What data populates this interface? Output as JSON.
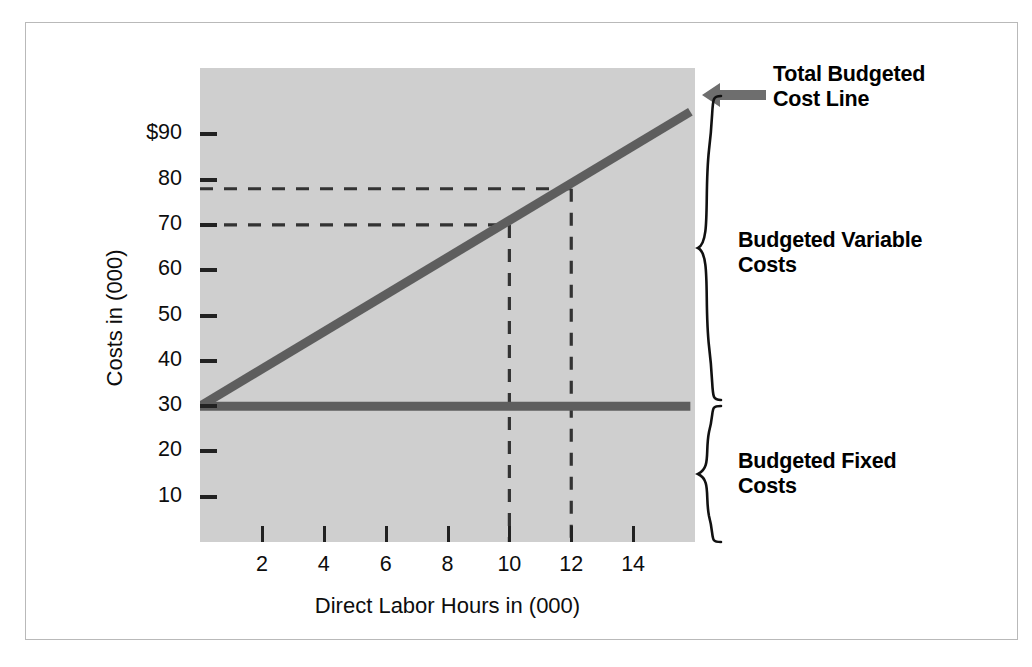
{
  "chart_data": {
    "type": "line",
    "title": "",
    "xlabel": "Direct Labor Hours in (000)",
    "ylabel": "Costs in (000)",
    "xlim": [
      0,
      16
    ],
    "ylim": [
      0,
      100
    ],
    "grid": false,
    "legend_position": "right-annotations",
    "x_ticks": [
      2,
      4,
      6,
      8,
      10,
      12,
      14
    ],
    "x_tick_labels": [
      "2",
      "4",
      "6",
      "8",
      "10",
      "12",
      "14"
    ],
    "y_ticks": [
      10,
      20,
      30,
      40,
      50,
      60,
      70,
      80,
      90
    ],
    "y_tick_labels": [
      "10",
      "20",
      "30",
      "40",
      "50",
      "60",
      "70",
      "80",
      "$90"
    ],
    "series": [
      {
        "name": "Total Budgeted Cost Line",
        "type": "line",
        "x": [
          0,
          15.85
        ],
        "values": [
          30,
          95
        ],
        "intercept": 30,
        "slope": 4.1,
        "color": "#5e5e5e"
      },
      {
        "name": "Budgeted Fixed Costs",
        "type": "line",
        "x": [
          0,
          15.85
        ],
        "values": [
          30,
          30
        ],
        "color": "#5e5e5e"
      }
    ],
    "guide_lines": [
      {
        "name": "horizontal-guide-78",
        "orientation": "horizontal",
        "value": 78,
        "from_x": 0,
        "to_x": 12
      },
      {
        "name": "horizontal-guide-70",
        "orientation": "horizontal",
        "value": 70,
        "from_x": 0,
        "to_x": 10
      },
      {
        "name": "vertical-guide-10",
        "orientation": "vertical",
        "value": 10,
        "from_y": 0,
        "to_y": 70
      },
      {
        "name": "vertical-guide-12",
        "orientation": "vertical",
        "value": 12,
        "from_y": 0,
        "to_y": 78
      }
    ],
    "annotations": [
      {
        "name": "total-budgeted-cost-line",
        "text": "Total Budgeted\nCost Line",
        "line1": "Total Budgeted",
        "line2": "Cost Line",
        "marker": "arrow-left",
        "points_to_y": 95
      },
      {
        "name": "budgeted-variable-costs",
        "text": "Budgeted Variable\nCosts",
        "line1": "Budgeted Variable",
        "line2": "Costs",
        "marker": "brace",
        "spans_y": [
          30,
          95
        ]
      },
      {
        "name": "budgeted-fixed-costs",
        "text": "Budgeted Fixed\nCosts",
        "line1": "Budgeted Fixed",
        "line2": "Costs",
        "marker": "brace",
        "spans_y": [
          0,
          30
        ]
      }
    ]
  },
  "colors": {
    "plot_background": "#cfcfcf",
    "line": "#5e5e5e",
    "axis_text": "#0d0d0d",
    "dash": "#333333",
    "border": "#b9b9b9",
    "arrow": "#6e6e6e"
  }
}
